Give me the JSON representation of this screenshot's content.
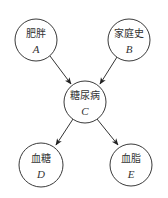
{
  "diagram": {
    "type": "bayesian-network",
    "nodes": [
      {
        "id": "A",
        "label": "肥胖",
        "var": "A",
        "cx": 36,
        "cy": 40,
        "r": 21
      },
      {
        "id": "B",
        "label": "家庭史",
        "var": "B",
        "cx": 129,
        "cy": 40,
        "r": 21
      },
      {
        "id": "C",
        "label": "糖尿病",
        "var": "C",
        "cx": 85,
        "cy": 102,
        "r": 21
      },
      {
        "id": "D",
        "label": "血糖",
        "var": "D",
        "cx": 41,
        "cy": 165,
        "r": 22
      },
      {
        "id": "E",
        "label": "血脂",
        "var": "E",
        "cx": 131,
        "cy": 165,
        "r": 21
      }
    ],
    "edges": [
      {
        "from": "A",
        "to": "C"
      },
      {
        "from": "B",
        "to": "C"
      },
      {
        "from": "C",
        "to": "D"
      },
      {
        "from": "C",
        "to": "E"
      }
    ],
    "colors": {
      "stroke": "#3a3a3a",
      "text": "#333333",
      "background": "#ffffff"
    }
  }
}
